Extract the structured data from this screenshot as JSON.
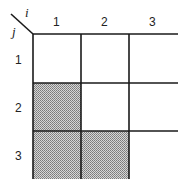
{
  "diagram": {
    "type": "lower-triangular-matrix-grid",
    "row_axis_label": "j",
    "col_axis_label": "i",
    "columns": [
      "1",
      "2",
      "3"
    ],
    "rows": [
      "1",
      "2",
      "3"
    ],
    "shaded_cells": [
      {
        "row": 2,
        "col": 1
      },
      {
        "row": 3,
        "col": 1
      },
      {
        "row": 3,
        "col": 2
      }
    ],
    "colors": {
      "line": "#1a1a1a",
      "shade": "#b8b8b8",
      "background": "#ffffff"
    }
  }
}
